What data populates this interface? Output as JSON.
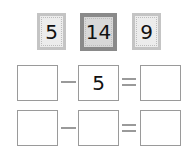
{
  "number_cards": [
    {
      "value": "5",
      "style": "light"
    },
    {
      "value": "14",
      "style": "dark"
    },
    {
      "value": "9",
      "style": "light"
    }
  ],
  "equations": [
    {
      "operand1": "",
      "operator": "−",
      "operand2": "5",
      "equals": "=",
      "result": ""
    },
    {
      "operand1": "",
      "operator": "−",
      "operand2": "",
      "equals": "=",
      "result": ""
    }
  ],
  "colors": {
    "light_card_border": "#c4c4c4",
    "dark_card_border": "#8a8a8a",
    "box_border": "#9a9a9a"
  }
}
